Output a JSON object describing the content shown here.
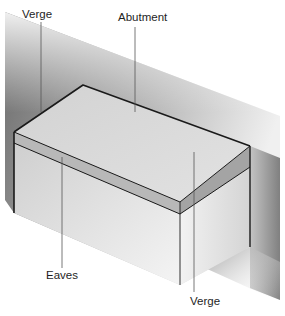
{
  "diagram": {
    "labels": {
      "verge_top": "Verge",
      "abutment": "Abutment",
      "eaves": "Eaves",
      "verge_bottom": "Verge"
    },
    "colors": {
      "background": "#ffffff",
      "wall_dark": "#5f5f5f",
      "wall_light": "#ffffff",
      "roof_top": "#d9d9d9",
      "fascia": "#a8a8a8",
      "front_face": "#dedede",
      "side_face": "#e6e6e6",
      "edge_line": "#1a1a1a",
      "leader_line": "#555555",
      "text": "#1e1e1e"
    }
  }
}
